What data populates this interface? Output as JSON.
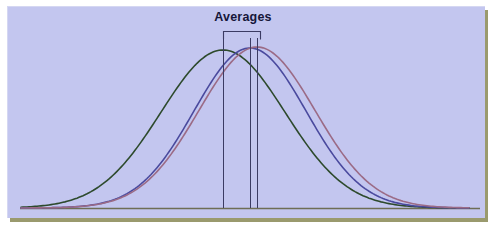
{
  "figure": {
    "width": 492,
    "height": 226,
    "panel_background": "#c3c6ef",
    "frame_color": "#9a9a6e",
    "page_background": "#ffffff"
  },
  "annotation": {
    "label": "Averages",
    "label_color": "#16163a",
    "bracket_color": "#3b3b63",
    "bracket_left_x": 222,
    "bracket_right_x": 259,
    "bracket_top_y": 30,
    "mean_line_color": "#3b3b63",
    "mean_line_top_y": 37,
    "mean_line_bottom_y": 207
  },
  "chart_data": {
    "type": "line",
    "title": "Averages",
    "xlabel": "",
    "ylabel": "",
    "grid": false,
    "legend": "none",
    "axis": {
      "baseline_y": 207,
      "baseline_color": "#6e6e55",
      "x_pixel_range": [
        20,
        468
      ],
      "y_pixel_range": [
        207,
        48
      ]
    },
    "series": [
      {
        "name": "green-curve",
        "color": "#2d4a2c",
        "stroke_width": 1.6,
        "mean_x": 222,
        "peak_y": 49,
        "sigma_px": 62,
        "note": "widest and left-most curve, lowest peak"
      },
      {
        "name": "blue-curve",
        "color": "#4a4a9e",
        "stroke_width": 1.6,
        "mean_x": 249,
        "peak_y": 47,
        "sigma_px": 56,
        "note": "middle curve"
      },
      {
        "name": "mauve-curve",
        "color": "#9b6b86",
        "stroke_width": 1.6,
        "mean_x": 256,
        "peak_y": 46,
        "sigma_px": 58,
        "note": "right-most curve, pink/mauve"
      }
    ],
    "mean_lines": [
      {
        "series": "green-curve",
        "x": 222
      },
      {
        "series": "blue-curve",
        "x": 249
      },
      {
        "series": "mauve-curve",
        "x": 256
      }
    ]
  }
}
